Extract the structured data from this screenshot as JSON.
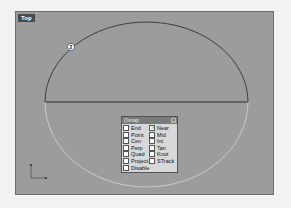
{
  "viewport": {
    "title": "Top",
    "background": "#9c9c9c",
    "point_marker_label": "2"
  },
  "osnap": {
    "title": "Osnap",
    "close_icon": "close-icon",
    "items": [
      {
        "label": "End",
        "checked": false
      },
      {
        "label": "Near",
        "checked": true
      },
      {
        "label": "Point",
        "checked": false
      },
      {
        "label": "Mid",
        "checked": false
      },
      {
        "label": "Cen",
        "checked": false
      },
      {
        "label": "Int",
        "checked": false
      },
      {
        "label": "Perp",
        "checked": false
      },
      {
        "label": "Tan",
        "checked": false
      },
      {
        "label": "Quad",
        "checked": false
      },
      {
        "label": "Knot",
        "checked": false
      },
      {
        "label": "Project",
        "checked": false
      },
      {
        "label": "STrack",
        "checked": false
      },
      {
        "label": "Disable",
        "checked": false
      }
    ]
  }
}
